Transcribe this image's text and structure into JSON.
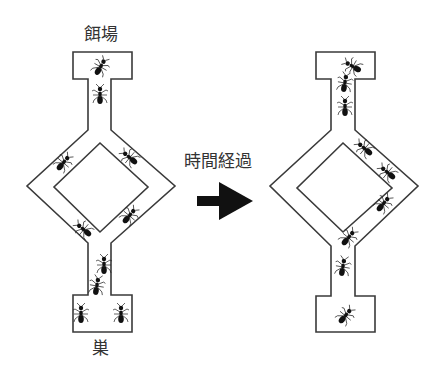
{
  "labels": {
    "food_source": "餌場",
    "nest": "巣",
    "time_elapsed": "時間経過"
  },
  "diagrams": [
    {
      "name": "before",
      "ants": [
        {
          "region": "food-box"
        },
        {
          "region": "upper-stem"
        },
        {
          "region": "left-path-upper"
        },
        {
          "region": "right-path-upper"
        },
        {
          "region": "right-path-lower"
        },
        {
          "region": "left-path-lower"
        },
        {
          "region": "lower-stem"
        },
        {
          "region": "lower-stem"
        },
        {
          "region": "nest-box"
        },
        {
          "region": "nest-box"
        }
      ]
    },
    {
      "name": "after",
      "ants": [
        {
          "region": "food-box"
        },
        {
          "region": "upper-stem"
        },
        {
          "region": "upper-stem"
        },
        {
          "region": "right-path-upper"
        },
        {
          "region": "right-path-upper"
        },
        {
          "region": "right-path-lower"
        },
        {
          "region": "right-path-lower"
        },
        {
          "region": "lower-stem"
        },
        {
          "region": "nest-box"
        }
      ]
    }
  ],
  "arrow": {
    "direction": "right",
    "color": "#111111"
  }
}
